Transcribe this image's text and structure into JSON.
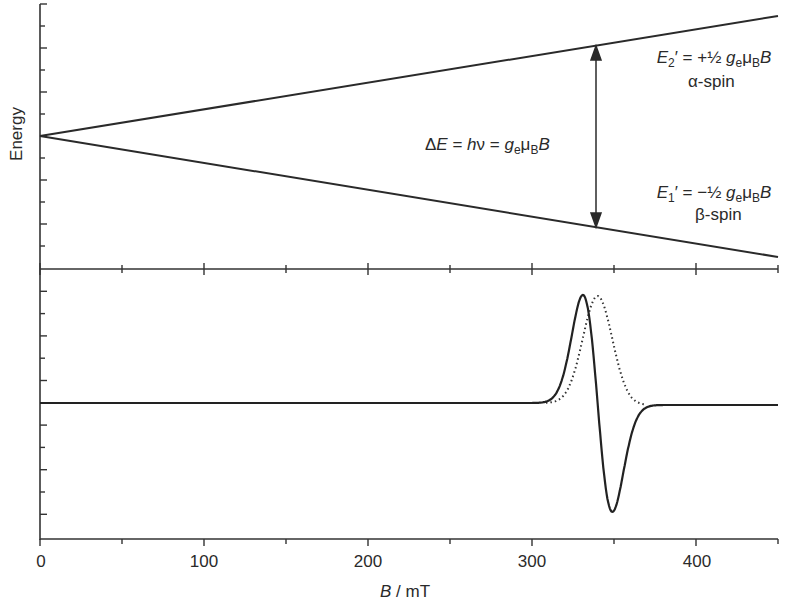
{
  "figure": {
    "y_axis_label": "Energy",
    "x_axis_label_var": "B",
    "x_axis_label_unit": " / mT",
    "x_tick_labels": [
      "0",
      "100",
      "200",
      "300",
      "400"
    ],
    "annotations": {
      "upper_level": {
        "E": "E",
        "sub": "2",
        "rest": "′ = +½ ",
        "g": "g",
        "g_sub": "e",
        "mu": "μ",
        "mu_sub": "B",
        "B": "B",
        "spin": "α-spin"
      },
      "lower_level": {
        "E": "E",
        "sub": "1",
        "rest": "′ = −½ ",
        "g": "g",
        "g_sub": "e",
        "mu": "μ",
        "mu_sub": "B",
        "B": "B",
        "spin": "β-spin"
      },
      "delta": {
        "delta": "Δ",
        "E": "E",
        "eq1": " = ",
        "h": "h",
        "nu": "ν",
        "eq2": " = ",
        "g": "g",
        "g_sub": "e",
        "mu": "μ",
        "mu_sub": "B",
        "B": "B"
      }
    }
  },
  "chart_data": [
    {
      "type": "line",
      "title": "Zeeman splitting of electron spin energy levels",
      "xlabel": "B / mT",
      "ylabel": "Energy",
      "xlim": [
        0,
        450
      ],
      "series": [
        {
          "name": "E2' = +1/2 g_e mu_B B (alpha-spin)",
          "x": [
            0,
            450
          ],
          "y": [
            0,
            1
          ]
        },
        {
          "name": "E1' = -1/2 g_e mu_B B (beta-spin)",
          "x": [
            0,
            450
          ],
          "y": [
            0,
            -1
          ]
        }
      ],
      "annotation": {
        "text": "ΔE = hν = g_e μ_B B",
        "at_B": 340
      }
    },
    {
      "type": "line",
      "title": "EPR spectrum",
      "xlabel": "B / mT",
      "ylabel": "",
      "xlim": [
        0,
        450
      ],
      "x_ticks": [
        0,
        100,
        200,
        300,
        400
      ],
      "resonance_field": 340,
      "series": [
        {
          "name": "first-derivative signal (solid)",
          "style": "solid",
          "peak_B": 330,
          "trough_B": 348,
          "relative_amplitude": 1.0
        },
        {
          "name": "absorption signal (dotted)",
          "style": "dotted",
          "peak_B": 340,
          "relative_amplitude": 1.0,
          "start_B": 308,
          "end_B": 370
        }
      ]
    }
  ]
}
